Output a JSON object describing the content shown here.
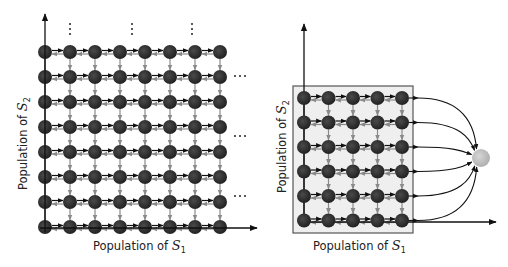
{
  "colors": {
    "node": "#2e2e2e",
    "forward_arrow": "#111111",
    "backward_arrow": "#8a8a8a",
    "down_arrow": "#8a8a8a",
    "box_fill": "#efefef",
    "box_border": "#555555",
    "absorbing_node": "#c4c4c4",
    "axis": "#111111"
  },
  "left_panel": {
    "x_label": "Population of ",
    "x_symbol": "S",
    "x_sub": "1",
    "y_label": "Population of ",
    "y_symbol": "S",
    "y_sub": "2",
    "grid": {
      "columns": 8,
      "rows": 8,
      "x0": 45,
      "dx": 25,
      "y0": 52,
      "dy": 25
    },
    "ellipsis": "⋯",
    "vertical_ellipsis": "⋮"
  },
  "right_panel": {
    "x_label": "Population of ",
    "x_symbol": "S",
    "x_sub": "1",
    "y_label": "Population of ",
    "y_symbol": "S",
    "y_sub": "2",
    "grid": {
      "columns": 5,
      "rows": 6,
      "x0": 304,
      "dx": 24.5,
      "y0": 98,
      "dy": 24.5
    },
    "absorbing_node": {
      "cx": 481,
      "cy": 158,
      "r": 9
    }
  }
}
